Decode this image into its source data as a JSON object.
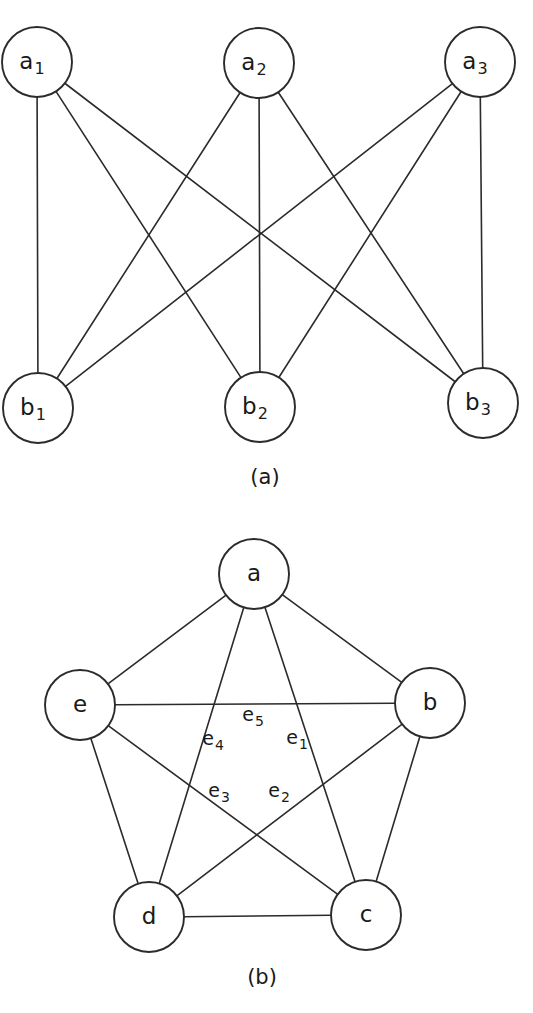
{
  "figure": {
    "width": 533,
    "height": 1013,
    "background_color": "#ffffff",
    "stroke_color": "#2b2b2b",
    "text_color": "#1a1a1a"
  },
  "panels": [
    {
      "id": "panel-a",
      "caption": "(a)",
      "caption_x": 265,
      "caption_y": 478,
      "graph_name": "complete bipartite graph K3,3",
      "node_radius": 35,
      "nodes": [
        {
          "id": "a1",
          "base": "a",
          "sub": "1",
          "x": 37,
          "y": 62
        },
        {
          "id": "a2",
          "base": "a",
          "sub": "2",
          "x": 259,
          "y": 63
        },
        {
          "id": "a3",
          "base": "a",
          "sub": "3",
          "x": 480,
          "y": 62
        },
        {
          "id": "b1",
          "base": "b",
          "sub": "1",
          "x": 38,
          "y": 408
        },
        {
          "id": "b2",
          "base": "b",
          "sub": "2",
          "x": 260,
          "y": 407
        },
        {
          "id": "b3",
          "base": "b",
          "sub": "3",
          "x": 483,
          "y": 403
        }
      ],
      "edges": [
        {
          "from": "a1",
          "to": "b1"
        },
        {
          "from": "a1",
          "to": "b2"
        },
        {
          "from": "a1",
          "to": "b3"
        },
        {
          "from": "a2",
          "to": "b1"
        },
        {
          "from": "a2",
          "to": "b2"
        },
        {
          "from": "a2",
          "to": "b3"
        },
        {
          "from": "a3",
          "to": "b1"
        },
        {
          "from": "a3",
          "to": "b2"
        },
        {
          "from": "a3",
          "to": "b3"
        }
      ],
      "edge_labels": []
    },
    {
      "id": "panel-b",
      "caption": "(b)",
      "caption_x": 262,
      "caption_y": 978,
      "graph_name": "complete graph K5",
      "node_radius": 35,
      "nodes": [
        {
          "id": "a",
          "base": "a",
          "sub": "",
          "x": 254,
          "y": 574
        },
        {
          "id": "b",
          "base": "b",
          "sub": "",
          "x": 430,
          "y": 703
        },
        {
          "id": "c",
          "base": "c",
          "sub": "",
          "x": 366,
          "y": 915
        },
        {
          "id": "d",
          "base": "d",
          "sub": "",
          "x": 149,
          "y": 917
        },
        {
          "id": "e",
          "base": "e",
          "sub": "",
          "x": 80,
          "y": 705
        }
      ],
      "edges": [
        {
          "from": "a",
          "to": "b"
        },
        {
          "from": "b",
          "to": "c"
        },
        {
          "from": "c",
          "to": "d"
        },
        {
          "from": "d",
          "to": "e"
        },
        {
          "from": "e",
          "to": "a"
        },
        {
          "from": "a",
          "to": "c"
        },
        {
          "from": "a",
          "to": "d"
        },
        {
          "from": "b",
          "to": "d"
        },
        {
          "from": "b",
          "to": "e"
        },
        {
          "from": "c",
          "to": "e"
        }
      ],
      "edge_labels": [
        {
          "id": "e1",
          "base": "e",
          "sub": "1",
          "x": 297,
          "y": 738
        },
        {
          "id": "e2",
          "base": "e",
          "sub": "2",
          "x": 279,
          "y": 791
        },
        {
          "id": "e3",
          "base": "e",
          "sub": "3",
          "x": 219,
          "y": 791
        },
        {
          "id": "e4",
          "base": "e",
          "sub": "4",
          "x": 213,
          "y": 739
        },
        {
          "id": "e5",
          "base": "e",
          "sub": "5",
          "x": 253,
          "y": 715
        }
      ]
    }
  ]
}
